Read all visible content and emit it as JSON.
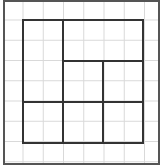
{
  "diagram": {
    "type": "grid-partition",
    "grid": {
      "columns": 8,
      "rows": 8,
      "cell_px": 20.3,
      "line_color": "#d9d9d9"
    },
    "frame": {
      "x": 4,
      "y": 1,
      "w": 155,
      "h": 163,
      "color": "#555555"
    },
    "square": {
      "x": 23,
      "y": 20,
      "w": 120,
      "h": 123,
      "color": "#333333"
    },
    "partition_lines": [
      {
        "x1": 63,
        "y1": 20,
        "x2": 63,
        "y2": 143
      },
      {
        "x1": 63,
        "y1": 61,
        "x2": 143,
        "y2": 61
      },
      {
        "x1": 103,
        "y1": 61,
        "x2": 103,
        "y2": 143
      },
      {
        "x1": 23,
        "y1": 102,
        "x2": 143,
        "y2": 102
      }
    ],
    "regions": [
      {
        "name": "left-tall",
        "cells": "2x4"
      },
      {
        "name": "top-right",
        "cells": "4x2"
      },
      {
        "name": "middle-center",
        "cells": "2x2"
      },
      {
        "name": "middle-right",
        "cells": "2x2"
      },
      {
        "name": "bottom-left",
        "cells": "2x2"
      },
      {
        "name": "bottom-center",
        "cells": "2x2"
      },
      {
        "name": "bottom-right",
        "cells": "2x2"
      }
    ]
  }
}
